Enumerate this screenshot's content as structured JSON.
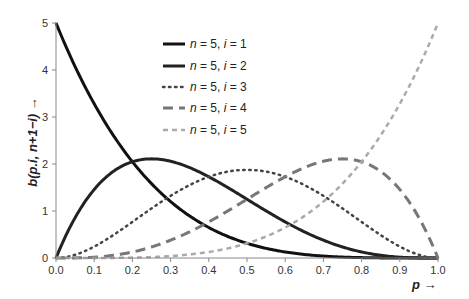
{
  "chart_data": {
    "type": "line",
    "title": "",
    "xlabel": "p →",
    "ylabel": "b(p.i, n+1−i) →",
    "xlim": [
      0,
      1
    ],
    "ylim": [
      0,
      5
    ],
    "grid": false,
    "legend_position": "upper-center",
    "x_ticks": [
      "0.0",
      "0.1",
      "0.2",
      "0.3",
      "0.4",
      "0.5",
      "0.6",
      "0.7",
      "0.8",
      "0.9",
      "1.0"
    ],
    "y_ticks": [
      "0",
      "1",
      "2",
      "3",
      "4",
      "5"
    ],
    "series": [
      {
        "name": "n = 5, i = 1",
        "n": 5,
        "i": 1,
        "style": "solid",
        "color": "#111111",
        "x": [
          0,
          0.1,
          0.2,
          0.3,
          0.4,
          0.5,
          0.6,
          0.7,
          0.8,
          0.9,
          1.0
        ],
        "values": [
          5.0,
          3.28,
          2.05,
          1.2,
          0.65,
          0.31,
          0.13,
          0.04,
          0.01,
          0.0,
          0.0
        ]
      },
      {
        "name": "n = 5, i = 2",
        "n": 5,
        "i": 2,
        "style": "solid",
        "color": "#222222",
        "x": [
          0,
          0.1,
          0.2,
          0.3,
          0.4,
          0.5,
          0.6,
          0.7,
          0.8,
          0.9,
          1.0
        ],
        "values": [
          0.0,
          1.46,
          2.05,
          2.06,
          1.73,
          1.25,
          0.77,
          0.38,
          0.13,
          0.02,
          0.0
        ]
      },
      {
        "name": "n = 5, i = 3",
        "n": 5,
        "i": 3,
        "style": "dotted",
        "color": "#444444",
        "x": [
          0,
          0.1,
          0.2,
          0.3,
          0.4,
          0.5,
          0.6,
          0.7,
          0.8,
          0.9,
          1.0
        ],
        "values": [
          0.0,
          0.24,
          0.77,
          1.32,
          1.73,
          1.88,
          1.73,
          1.32,
          0.77,
          0.24,
          0.0
        ]
      },
      {
        "name": "n = 5, i = 4",
        "n": 5,
        "i": 4,
        "style": "dashed",
        "color": "#777777",
        "x": [
          0,
          0.1,
          0.2,
          0.3,
          0.4,
          0.5,
          0.6,
          0.7,
          0.8,
          0.9,
          1.0
        ],
        "values": [
          0.0,
          0.02,
          0.13,
          0.38,
          0.77,
          1.25,
          1.73,
          2.06,
          2.05,
          1.46,
          0.0
        ]
      },
      {
        "name": "n = 5, i = 5",
        "n": 5,
        "i": 5,
        "style": "short-dashed",
        "color": "#aaaaaa",
        "x": [
          0,
          0.1,
          0.2,
          0.3,
          0.4,
          0.5,
          0.6,
          0.7,
          0.8,
          0.9,
          1.0
        ],
        "values": [
          0.0,
          0.0,
          0.01,
          0.04,
          0.13,
          0.31,
          0.65,
          1.2,
          2.05,
          3.28,
          5.0
        ]
      }
    ]
  },
  "legend": {
    "items": [
      {
        "label": "n = 5, i = 1"
      },
      {
        "label": "n = 5, i = 2"
      },
      {
        "label": "n = 5, i = 3"
      },
      {
        "label": "n = 5, i = 4"
      },
      {
        "label": "n = 5, i = 5"
      }
    ]
  },
  "axes": {
    "xlabel": "p →",
    "ylabel": "b(p.i, n+1−i) →"
  }
}
